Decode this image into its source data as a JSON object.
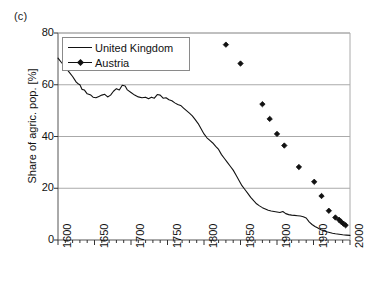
{
  "panel": {
    "label": "(c)"
  },
  "legend": {
    "position": "top-left-inside",
    "entries": [
      {
        "label": "United Kingdom",
        "style": "line",
        "color": "#111111"
      },
      {
        "label": "Austria",
        "style": "marker-line",
        "color": "#111111"
      }
    ]
  },
  "axes": {
    "y_title": "Share of agric. pop. [%]",
    "y_ticks": [
      "0",
      "20",
      "40",
      "60",
      "80"
    ],
    "x_ticks": [
      "1600",
      "1650",
      "1700",
      "1750",
      "1800",
      "1850",
      "1900",
      "1950",
      "2000"
    ],
    "x_title": ""
  },
  "chart_data": {
    "type": "line",
    "title": "",
    "subtitle": "",
    "xlabel": "",
    "ylabel": "Share of agric. pop. [%]",
    "xlim": [
      1600,
      2000
    ],
    "ylim": [
      0,
      80
    ],
    "yticks": [
      0,
      20,
      40,
      60,
      80
    ],
    "xticks": [
      1600,
      1650,
      1700,
      1750,
      1800,
      1850,
      1900,
      1950,
      2000
    ],
    "x_minor_tick_step": 10,
    "grid": "horizontal",
    "grid_color": "#aaaaaa",
    "legend_position": "upper left (inside axes)",
    "panel_label": "(c)",
    "series": [
      {
        "name": "United Kingdom",
        "type": "line",
        "color": "#111111",
        "marker": "none",
        "points": [
          [
            1600,
            70.3
          ],
          [
            1605,
            68.5
          ],
          [
            1610,
            66.8
          ],
          [
            1615,
            65.0
          ],
          [
            1620,
            63.2
          ],
          [
            1625,
            61.0
          ],
          [
            1628,
            60.3
          ],
          [
            1630,
            60.0
          ],
          [
            1633,
            58.2
          ],
          [
            1636,
            58.0
          ],
          [
            1640,
            56.5
          ],
          [
            1645,
            56.0
          ],
          [
            1648,
            55.2
          ],
          [
            1652,
            55.0
          ],
          [
            1656,
            55.5
          ],
          [
            1660,
            56.0
          ],
          [
            1664,
            56.3
          ],
          [
            1668,
            55.3
          ],
          [
            1672,
            56.0
          ],
          [
            1676,
            57.5
          ],
          [
            1680,
            58.5
          ],
          [
            1684,
            58.0
          ],
          [
            1688,
            59.8
          ],
          [
            1692,
            59.5
          ],
          [
            1695,
            58.0
          ],
          [
            1700,
            57.0
          ],
          [
            1705,
            56.0
          ],
          [
            1710,
            55.3
          ],
          [
            1715,
            55.0
          ],
          [
            1720,
            55.2
          ],
          [
            1724,
            54.6
          ],
          [
            1728,
            55.2
          ],
          [
            1732,
            54.8
          ],
          [
            1736,
            56.2
          ],
          [
            1740,
            56.0
          ],
          [
            1744,
            54.8
          ],
          [
            1748,
            55.0
          ],
          [
            1752,
            54.2
          ],
          [
            1756,
            53.8
          ],
          [
            1760,
            53.0
          ],
          [
            1764,
            52.4
          ],
          [
            1768,
            52.0
          ],
          [
            1772,
            51.0
          ],
          [
            1776,
            50.0
          ],
          [
            1780,
            49.0
          ],
          [
            1784,
            48.0
          ],
          [
            1788,
            46.5
          ],
          [
            1792,
            45.0
          ],
          [
            1796,
            43.0
          ],
          [
            1800,
            41.0
          ],
          [
            1804,
            39.5
          ],
          [
            1808,
            38.5
          ],
          [
            1812,
            37.5
          ],
          [
            1816,
            36.2
          ],
          [
            1820,
            35.0
          ],
          [
            1824,
            33.0
          ],
          [
            1828,
            31.5
          ],
          [
            1832,
            30.0
          ],
          [
            1836,
            28.5
          ],
          [
            1840,
            27.0
          ],
          [
            1844,
            25.0
          ],
          [
            1848,
            23.0
          ],
          [
            1852,
            21.0
          ],
          [
            1856,
            19.5
          ],
          [
            1860,
            18.0
          ],
          [
            1864,
            16.5
          ],
          [
            1868,
            15.2
          ],
          [
            1872,
            14.0
          ],
          [
            1876,
            13.2
          ],
          [
            1880,
            12.5
          ],
          [
            1884,
            12.0
          ],
          [
            1888,
            11.5
          ],
          [
            1892,
            11.2
          ],
          [
            1896,
            11.0
          ],
          [
            1900,
            10.8
          ],
          [
            1904,
            10.6
          ],
          [
            1908,
            11.0
          ],
          [
            1912,
            10.2
          ],
          [
            1916,
            9.8
          ],
          [
            1920,
            9.6
          ],
          [
            1924,
            9.5
          ],
          [
            1928,
            9.4
          ],
          [
            1932,
            9.3
          ],
          [
            1936,
            9.0
          ],
          [
            1940,
            8.5
          ],
          [
            1944,
            7.0
          ],
          [
            1948,
            6.0
          ],
          [
            1952,
            5.2
          ],
          [
            1956,
            4.6
          ],
          [
            1960,
            4.0
          ],
          [
            1964,
            3.6
          ],
          [
            1968,
            3.2
          ],
          [
            1972,
            2.9
          ],
          [
            1976,
            2.6
          ],
          [
            1980,
            2.4
          ],
          [
            1985,
            2.2
          ],
          [
            1990,
            2.0
          ],
          [
            1995,
            1.9
          ],
          [
            2000,
            1.8
          ]
        ]
      },
      {
        "name": "Austria",
        "type": "scatter",
        "color": "#111111",
        "marker": "diamond",
        "points": [
          [
            1830,
            75.5
          ],
          [
            1850,
            68.2
          ],
          [
            1880,
            52.5
          ],
          [
            1890,
            46.8
          ],
          [
            1900,
            41.0
          ],
          [
            1910,
            36.5
          ],
          [
            1930,
            28.2
          ],
          [
            1951,
            22.5
          ],
          [
            1961,
            17.0
          ],
          [
            1971,
            11.3
          ],
          [
            1980,
            8.7
          ],
          [
            1985,
            7.8
          ],
          [
            1988,
            7.0
          ],
          [
            1991,
            6.3
          ],
          [
            1994,
            5.7
          ]
        ]
      }
    ]
  }
}
